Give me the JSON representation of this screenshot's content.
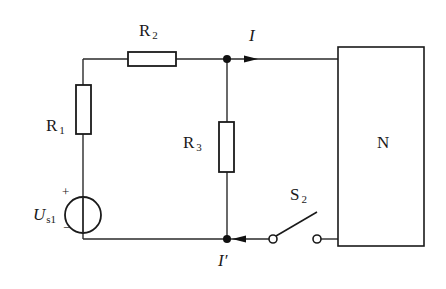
{
  "diagram": {
    "type": "circuit-schematic",
    "components": {
      "R1": {
        "label": "R",
        "subscript": "1"
      },
      "R2": {
        "label": "R",
        "subscript": "2"
      },
      "R3": {
        "label": "R",
        "subscript": "3"
      },
      "source": {
        "label": "U",
        "subscript": "s1",
        "plus": "+",
        "minus": "−"
      },
      "switch": {
        "label": "S",
        "subscript": "2",
        "state": "open"
      },
      "network": {
        "label": "N"
      }
    },
    "currents": {
      "top": {
        "label": "I",
        "direction": "right"
      },
      "bottom": {
        "label": "I′",
        "direction": "left"
      }
    }
  }
}
